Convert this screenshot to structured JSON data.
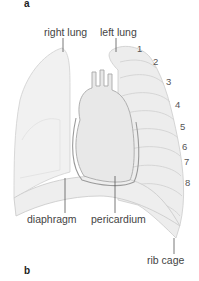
{
  "figure": {
    "panel_top": "a",
    "panel_bottom": "b",
    "labels": {
      "right_lung": "right lung",
      "left_lung": "left lung",
      "diaphragm": "diaphragm",
      "pericardium": "pericardium",
      "rib_cage": "rib cage"
    },
    "rib_numbers": [
      "1",
      "2",
      "3",
      "4",
      "5",
      "6",
      "7",
      "8"
    ]
  }
}
